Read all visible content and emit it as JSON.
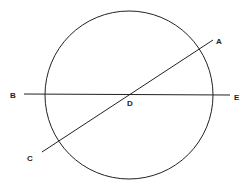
{
  "diagram": {
    "circle": {
      "cx": 129,
      "cy": 95,
      "r": 84
    },
    "lines": [
      {
        "name": "BE",
        "x1": 24,
        "y1": 94,
        "x2": 230,
        "y2": 95
      },
      {
        "name": "CA",
        "x1": 42,
        "y1": 152,
        "x2": 213,
        "y2": 40
      }
    ],
    "labels": {
      "A": "A",
      "B": "B",
      "C": "C",
      "D": "D",
      "E": "E"
    },
    "stroke_color": "#222222"
  }
}
